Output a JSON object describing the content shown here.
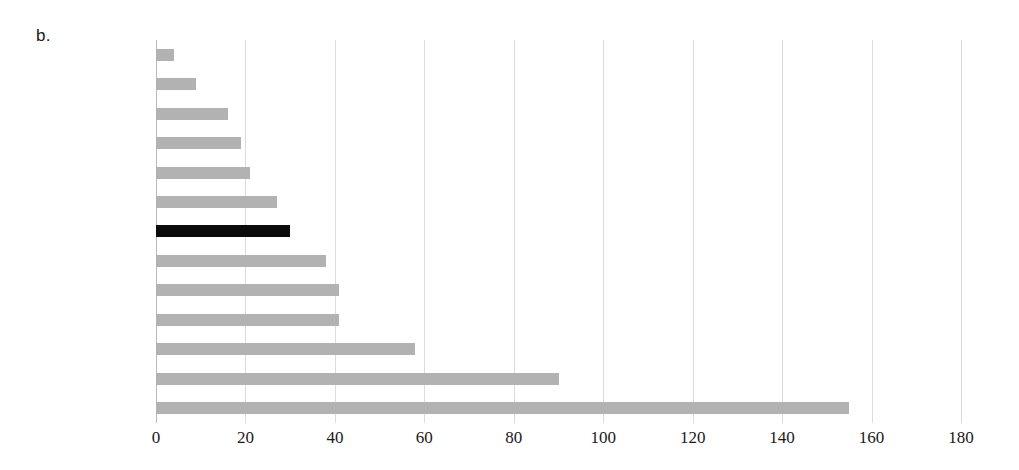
{
  "figure": {
    "panel_letter": "b."
  },
  "chart_data": {
    "type": "bar",
    "orientation": "horizontal",
    "title": "",
    "xlabel": "",
    "ylabel": "",
    "xlim": [
      0,
      180
    ],
    "xticks": [
      0,
      20,
      40,
      60,
      80,
      100,
      120,
      140,
      160,
      180
    ],
    "xtick_labels": [
      "0",
      "20",
      "40",
      "60",
      "80",
      "100",
      "120",
      "140",
      "160",
      "180"
    ],
    "grid": true,
    "grid_axis": "x",
    "legend": "none",
    "categories": [
      "Ireland",
      "Malta",
      "Italy",
      "Portugal",
      "Netherlands",
      "Austria",
      "Greece",
      "Luxembourg",
      "Belgium",
      "Spain",
      "France",
      "Finland",
      "Germany"
    ],
    "values": [
      4,
      9,
      16,
      19,
      21,
      27,
      30,
      38,
      41,
      41,
      58,
      90,
      155
    ],
    "highlight_category": "Greece",
    "colors": {
      "bar": "#b2b2b2",
      "bar_highlight": "#0b0b0b",
      "gridline": "#dcdcdc",
      "axis": "#b9b9b9",
      "text": "#111111",
      "background": "#ffffff"
    }
  }
}
